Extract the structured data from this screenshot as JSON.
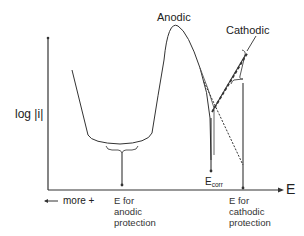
{
  "diagram": {
    "y_axis_label": "log |i|",
    "x_axis_label": "E",
    "direction_label": "more +",
    "curve_labels": {
      "anodic": "Anodic",
      "cathodic": "Cathodic"
    },
    "markers": {
      "ecorr_main": "E",
      "ecorr_sub": "corr",
      "anodic_protection": [
        "E for",
        "anodic",
        "protection"
      ],
      "cathodic_protection": [
        "E for",
        "cathodic",
        "protection"
      ]
    },
    "colors": {
      "line": "#333333",
      "text": "#222222",
      "background": "#ffffff"
    }
  }
}
